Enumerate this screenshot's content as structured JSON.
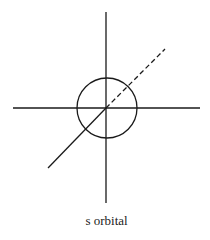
{
  "diagram": {
    "title": "s orbital",
    "caption": "s orbital",
    "stroke_color": "#1a1a1a",
    "elements": {
      "y_axis": {
        "x1": 106,
        "y1": 12,
        "x2": 106,
        "y2": 203
      },
      "x_axis": {
        "x1": 13,
        "y1": 108,
        "x2": 200,
        "y2": 108
      },
      "z_axis_front": {
        "x1": 106,
        "y1": 108,
        "x2": 48,
        "y2": 168
      },
      "z_axis_back_dashed": {
        "x1": 106,
        "y1": 108,
        "x2": 165,
        "y2": 49
      },
      "orbital_sphere": {
        "cx": 107,
        "cy": 108,
        "r": 30
      }
    }
  }
}
